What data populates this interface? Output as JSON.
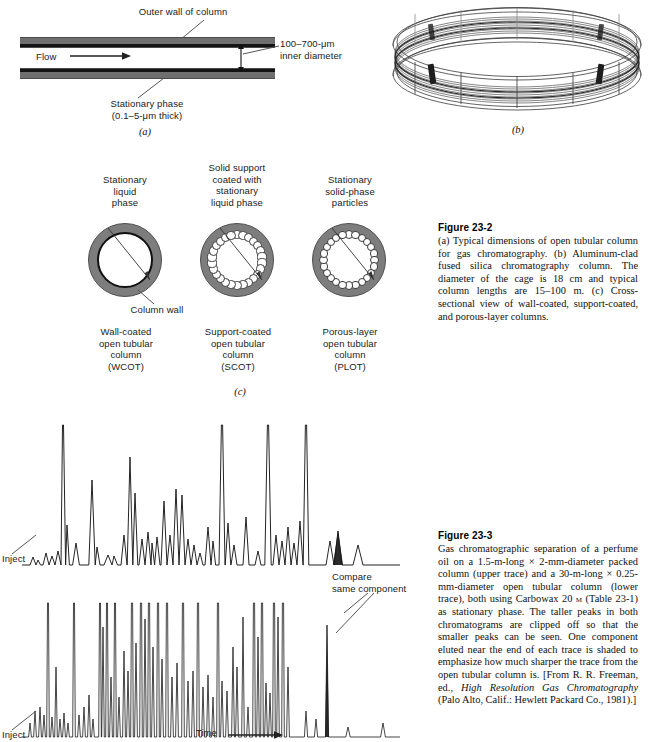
{
  "figure_23_2": {
    "panel_a": {
      "letter": "(a)",
      "label_outer_wall": "Outer wall of column",
      "label_flow": "Flow",
      "label_inner_diameter": "100–700-μm\ninner diameter",
      "label_stationary_phase": "Stationary phase\n(0.1–5-μm thick)"
    },
    "panel_b": {
      "letter": "(b)"
    },
    "panel_c": {
      "letter": "(c)",
      "cross_sections": [
        {
          "id": "wcot",
          "top_label": "Stationary\nliquid\nphase",
          "bottom_label": "Wall-coated\nopen tubular\ncolumn\n(WCOT)",
          "extra_label": "Column wall"
        },
        {
          "id": "scot",
          "top_label": "Solid support\ncoated with\nstationary\nliquid phase",
          "bottom_label": "Support-coated\nopen tubular\ncolumn\n(SCOT)",
          "extra_label": ""
        },
        {
          "id": "plot",
          "top_label": "Stationary\nsolid-phase\nparticles",
          "bottom_label": "Porous-layer\nopen tubular\ncolumn\n(PLOT)",
          "extra_label": ""
        }
      ]
    },
    "caption": {
      "title": "Figure 23-2",
      "text": "(a) Typical dimensions of open tubular column for gas chromatography. (b) Aluminum-clad fused silica chromatography column. The diameter of the cage is 18 cm and typical column lengths are 15–100 m. (c) Cross-sectional view of wall-coated, support-coated, and porous-layer columns."
    }
  },
  "figure_23_3": {
    "label_inject_upper": "Inject",
    "label_inject_lower": "Inject",
    "label_compare": "Compare\nsame component",
    "label_time": "Time",
    "caption": {
      "title": "Figure 23-3",
      "text_part1": "Gas chromatographic separation of a perfume oil on a 1.5-m-long × 2-mm-diameter packed column (upper trace) and a 30-m-long × 0.25-mm-diameter open tubular column (lower trace), both using Carbowax 20 ",
      "text_smallcaps": "m",
      "text_part2": " (Table 23-1) as stationary phase. The taller peaks in both chromatograms are clipped off so that the smaller peaks can be seen. One component eluted near the end of each trace is shaded to emphasize how much sharper the trace from the open tubular column is. [From R. R. Freeman, ed., ",
      "text_italic": "High Resolution Gas Chromatography",
      "text_part3": " (Palo Alto, Calif.: Hewlett Packard Co., 1981).]"
    }
  },
  "chart_data": {
    "type": "line",
    "title": "Gas chromatographic separation of a perfume oil",
    "xlabel": "Time",
    "ylabel": "Detector response",
    "grid": false,
    "legend": "none",
    "annotations": [
      "Inject",
      "Inject",
      "Compare same component",
      "Time"
    ],
    "series": [
      {
        "name": "packed column (upper trace, 1.5-m-long x 2-mm-diameter)",
        "baseline_y": 160,
        "clip_y": 20,
        "peaks": [
          {
            "x": 33,
            "h": 8,
            "w": 3
          },
          {
            "x": 38,
            "h": 5,
            "w": 2.5
          },
          {
            "x": 46,
            "h": 12,
            "w": 3
          },
          {
            "x": 52,
            "h": 9,
            "w": 3
          },
          {
            "x": 58,
            "h": 14,
            "w": 3
          },
          {
            "x": 63,
            "h": 140,
            "w": 2.6
          },
          {
            "x": 67,
            "h": 40,
            "w": 2.4
          },
          {
            "x": 76,
            "h": 22,
            "w": 3.4
          },
          {
            "x": 92,
            "h": 85,
            "w": 3.2
          },
          {
            "x": 97,
            "h": 18,
            "w": 3
          },
          {
            "x": 108,
            "h": 10,
            "w": 4
          },
          {
            "x": 114,
            "h": 9,
            "w": 3.5
          },
          {
            "x": 124,
            "h": 30,
            "w": 3
          },
          {
            "x": 130,
            "h": 108,
            "w": 2.8
          },
          {
            "x": 135,
            "h": 72,
            "w": 2.8
          },
          {
            "x": 142,
            "h": 26,
            "w": 3
          },
          {
            "x": 148,
            "h": 33,
            "w": 3
          },
          {
            "x": 152,
            "h": 22,
            "w": 2.6
          },
          {
            "x": 157,
            "h": 28,
            "w": 3
          },
          {
            "x": 164,
            "h": 64,
            "w": 3
          },
          {
            "x": 170,
            "h": 30,
            "w": 3
          },
          {
            "x": 176,
            "h": 76,
            "w": 3
          },
          {
            "x": 182,
            "h": 70,
            "w": 3
          },
          {
            "x": 188,
            "h": 26,
            "w": 3
          },
          {
            "x": 194,
            "h": 20,
            "w": 3
          },
          {
            "x": 200,
            "h": 12,
            "w": 3
          },
          {
            "x": 208,
            "h": 38,
            "w": 3
          },
          {
            "x": 213,
            "h": 24,
            "w": 2.6
          },
          {
            "x": 222,
            "h": 140,
            "w": 3.0
          },
          {
            "x": 228,
            "h": 42,
            "w": 2.8
          },
          {
            "x": 234,
            "h": 20,
            "w": 3
          },
          {
            "x": 246,
            "h": 48,
            "w": 3
          },
          {
            "x": 258,
            "h": 14,
            "w": 3
          },
          {
            "x": 268,
            "h": 140,
            "w": 3.2
          },
          {
            "x": 276,
            "h": 30,
            "w": 3
          },
          {
            "x": 282,
            "h": 24,
            "w": 3
          },
          {
            "x": 288,
            "h": 38,
            "w": 3
          },
          {
            "x": 294,
            "h": 22,
            "w": 3
          },
          {
            "x": 300,
            "h": 44,
            "w": 3
          },
          {
            "x": 306,
            "h": 140,
            "w": 2.8
          },
          {
            "x": 330,
            "h": 24,
            "w": 4
          },
          {
            "x": 338,
            "h": 34,
            "w": 4
          },
          {
            "x": 358,
            "h": 20,
            "w": 5
          }
        ],
        "shaded_peak_x": 338
      },
      {
        "name": "open tubular column (lower trace, 30-m-long x 0.25-mm-diameter)",
        "baseline_y": 332,
        "clip_y": 198,
        "peaks": [
          {
            "x": 30,
            "h": 14,
            "w": 1.4
          },
          {
            "x": 35,
            "h": 26,
            "w": 1.4
          },
          {
            "x": 40,
            "h": 30,
            "w": 1.4
          },
          {
            "x": 44,
            "h": 22,
            "w": 1.4
          },
          {
            "x": 48,
            "h": 134,
            "w": 1.3
          },
          {
            "x": 52,
            "h": 20,
            "w": 1.4
          },
          {
            "x": 56,
            "h": 70,
            "w": 1.3
          },
          {
            "x": 60,
            "h": 18,
            "w": 1.4
          },
          {
            "x": 64,
            "h": 24,
            "w": 1.4
          },
          {
            "x": 68,
            "h": 14,
            "w": 1.4
          },
          {
            "x": 74,
            "h": 134,
            "w": 1.3
          },
          {
            "x": 79,
            "h": 22,
            "w": 1.4
          },
          {
            "x": 84,
            "h": 30,
            "w": 1.4
          },
          {
            "x": 89,
            "h": 42,
            "w": 1.4
          },
          {
            "x": 93,
            "h": 18,
            "w": 1.4
          },
          {
            "x": 100,
            "h": 134,
            "w": 1.3
          },
          {
            "x": 103,
            "h": 110,
            "w": 1.3
          },
          {
            "x": 107,
            "h": 134,
            "w": 1.3
          },
          {
            "x": 111,
            "h": 60,
            "w": 1.4
          },
          {
            "x": 115,
            "h": 134,
            "w": 1.3
          },
          {
            "x": 119,
            "h": 40,
            "w": 1.4
          },
          {
            "x": 124,
            "h": 86,
            "w": 1.4
          },
          {
            "x": 128,
            "h": 66,
            "w": 1.4
          },
          {
            "x": 132,
            "h": 134,
            "w": 1.3
          },
          {
            "x": 136,
            "h": 94,
            "w": 1.4
          },
          {
            "x": 141,
            "h": 134,
            "w": 1.3
          },
          {
            "x": 145,
            "h": 118,
            "w": 1.3
          },
          {
            "x": 149,
            "h": 134,
            "w": 1.3
          },
          {
            "x": 153,
            "h": 90,
            "w": 1.4
          },
          {
            "x": 158,
            "h": 134,
            "w": 1.3
          },
          {
            "x": 162,
            "h": 78,
            "w": 1.4
          },
          {
            "x": 167,
            "h": 134,
            "w": 1.3
          },
          {
            "x": 172,
            "h": 60,
            "w": 1.4
          },
          {
            "x": 177,
            "h": 74,
            "w": 1.4
          },
          {
            "x": 183,
            "h": 134,
            "w": 1.3
          },
          {
            "x": 188,
            "h": 56,
            "w": 1.4
          },
          {
            "x": 193,
            "h": 66,
            "w": 1.4
          },
          {
            "x": 198,
            "h": 134,
            "w": 1.3
          },
          {
            "x": 203,
            "h": 50,
            "w": 1.4
          },
          {
            "x": 208,
            "h": 62,
            "w": 1.4
          },
          {
            "x": 213,
            "h": 40,
            "w": 1.4
          },
          {
            "x": 218,
            "h": 134,
            "w": 1.3
          },
          {
            "x": 222,
            "h": 56,
            "w": 1.4
          },
          {
            "x": 227,
            "h": 46,
            "w": 1.4
          },
          {
            "x": 233,
            "h": 90,
            "w": 1.4
          },
          {
            "x": 237,
            "h": 70,
            "w": 1.4
          },
          {
            "x": 243,
            "h": 120,
            "w": 1.3
          },
          {
            "x": 248,
            "h": 30,
            "w": 1.4
          },
          {
            "x": 254,
            "h": 134,
            "w": 1.3
          },
          {
            "x": 258,
            "h": 100,
            "w": 1.3
          },
          {
            "x": 262,
            "h": 134,
            "w": 1.3
          },
          {
            "x": 266,
            "h": 54,
            "w": 1.4
          },
          {
            "x": 270,
            "h": 44,
            "w": 1.4
          },
          {
            "x": 274,
            "h": 134,
            "w": 1.3
          },
          {
            "x": 278,
            "h": 120,
            "w": 1.3
          },
          {
            "x": 283,
            "h": 134,
            "w": 1.3
          },
          {
            "x": 288,
            "h": 70,
            "w": 1.4
          },
          {
            "x": 306,
            "h": 26,
            "w": 1.6
          },
          {
            "x": 316,
            "h": 18,
            "w": 1.6
          },
          {
            "x": 327,
            "h": 112,
            "w": 1.5
          },
          {
            "x": 348,
            "h": 10,
            "w": 2.2
          },
          {
            "x": 383,
            "h": 14,
            "w": 2.4
          }
        ],
        "shaded_peak_x": 327
      }
    ]
  }
}
